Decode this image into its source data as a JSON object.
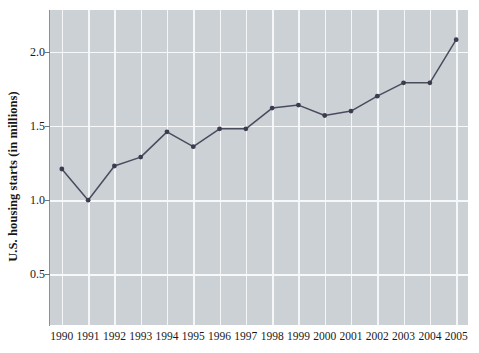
{
  "chart_data": {
    "type": "line",
    "title": "",
    "xlabel": "",
    "ylabel": "U.S. housing starts (in millions)",
    "categories": [
      "1990",
      "1991",
      "1992",
      "1993",
      "1994",
      "1995",
      "1996",
      "1997",
      "1998",
      "1999",
      "2000",
      "2001",
      "2002",
      "2003",
      "2004",
      "2005"
    ],
    "x": [
      1990,
      1991,
      1992,
      1993,
      1994,
      1995,
      1996,
      1997,
      1998,
      1999,
      2000,
      2001,
      2002,
      2003,
      2004,
      2005
    ],
    "values": [
      1.21,
      1.0,
      1.23,
      1.29,
      1.46,
      1.36,
      1.48,
      1.48,
      1.62,
      1.64,
      1.57,
      1.6,
      1.7,
      1.79,
      1.79,
      2.08
    ],
    "series": [
      {
        "name": "U.S. housing starts",
        "values": [
          1.21,
          1.0,
          1.23,
          1.29,
          1.46,
          1.36,
          1.48,
          1.48,
          1.62,
          1.64,
          1.57,
          1.6,
          1.7,
          1.79,
          1.79,
          2.08
        ]
      }
    ],
    "ylim": [
      0.16,
      2.28
    ],
    "xlim": [
      1989.55,
      2005.45
    ],
    "y_ticks": [
      0.5,
      1.0,
      1.5,
      2.0
    ],
    "y_tick_labels": [
      "0.5",
      "1.0",
      "1.5",
      "2.0"
    ],
    "x_ticks": [
      1990,
      1991,
      1992,
      1993,
      1994,
      1995,
      1996,
      1997,
      1998,
      1999,
      2000,
      2001,
      2002,
      2003,
      2004,
      2005
    ],
    "grid": true,
    "grid_color": "#f4f6f7",
    "legend": null,
    "legend_position": "none",
    "plot_background": "#ccd1d6",
    "figure_background": "#ffffff",
    "line_color": "#4b4b5e",
    "marker_color": "#3c3c4e",
    "marker": "circle",
    "axis_line_color": "#8d9296",
    "annotations": []
  },
  "axes": {
    "y_title": "U.S. housing starts (in millions)"
  }
}
